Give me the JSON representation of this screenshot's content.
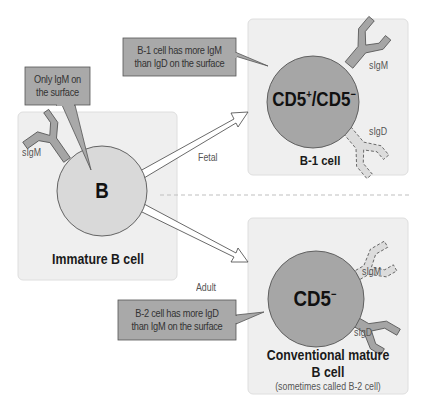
{
  "diagram": {
    "colors": {
      "panel_fill": "#efefef",
      "panel_border": "#dedede",
      "immature_cell_fill": "#d9d9d9",
      "mature_cell_fill": "#a6a6a6",
      "callout_fill": "#a9a9a9",
      "callout_border": "#555555",
      "receptor_solid": "#a5a5a5",
      "receptor_dashed": "#dcdcdc",
      "arrow_fill": "#ffffff",
      "arrow_stroke": "#444444",
      "divider": "#bfbfbf"
    },
    "immature": {
      "callout": [
        "Only IgM on",
        "the surface"
      ],
      "cell_label": "B",
      "receptor_label": "sIgM",
      "name": "Immature B cell"
    },
    "arrows": {
      "fetal": "Fetal",
      "adult": "Adult"
    },
    "b1": {
      "callout": [
        "B-1 cell has more IgM",
        "than IgD on the surface"
      ],
      "cell_label_main": "CD5",
      "cell_label_sup1": "+",
      "cell_label_mid": "/CD5",
      "cell_label_sup2": "−",
      "receptor_solid_label": "sIgM",
      "receptor_dashed_label": "sIgD",
      "name": "B-1 cell"
    },
    "b2": {
      "callout": [
        "B-2 cell has more IgD",
        "than IgM on the surface"
      ],
      "cell_label_main": "CD5",
      "cell_label_sup": "−",
      "receptor_dashed_label": "sIgM",
      "receptor_solid_label": "sIgD",
      "name_line1": "Conventional mature",
      "name_line2": "B cell",
      "subtitle": "(sometimes called B-2 cell)"
    }
  }
}
